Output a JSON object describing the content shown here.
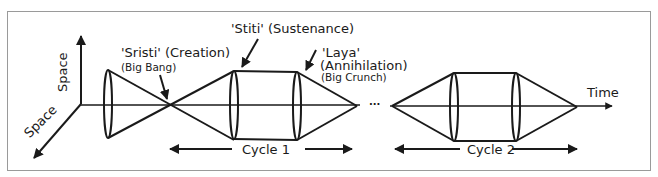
{
  "diagram": {
    "axes": {
      "vertical_label": "Space",
      "diagonal_label": "Space",
      "horizontal_label": "Time"
    },
    "annotations": {
      "creation": {
        "title": "'Sristi' (Creation)",
        "subtitle": "(Big Bang)"
      },
      "sustenance": {
        "title": "'Stiti' (Sustenance)"
      },
      "annihilation": {
        "title_line1": "'Laya'",
        "title_line2": "(Annihilation)",
        "subtitle": "(Big Crunch)"
      }
    },
    "continuation": "...",
    "cycles": [
      {
        "label": "Cycle 1"
      },
      {
        "label": "Cycle 2"
      }
    ],
    "stroke_color": "#1a1a1a",
    "frame_color": "#9a9a9a"
  }
}
